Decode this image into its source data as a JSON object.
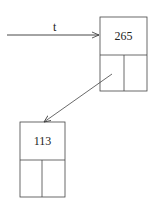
{
  "pointer": {
    "label": "t"
  },
  "nodes": [
    {
      "id": "root",
      "key": "265"
    },
    {
      "id": "left-child",
      "key": "113"
    }
  ]
}
